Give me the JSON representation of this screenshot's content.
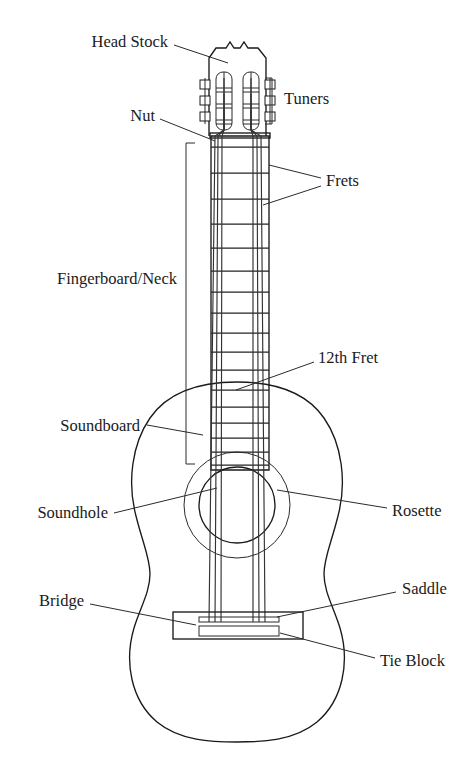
{
  "diagram": {
    "type": "labeled-line-drawing",
    "width": 471,
    "height": 770,
    "background_color": "#ffffff",
    "line_color": "#1a1a1a",
    "text_color": "#1a1a1a"
  },
  "labels": {
    "head_stock": "Head Stock",
    "tuners": "Tuners",
    "nut": "Nut",
    "frets": "Frets",
    "fingerboard_neck": "Fingerboard/Neck",
    "twelfth_fret": "12th Fret",
    "soundboard": "Soundboard",
    "soundhole": "Soundhole",
    "rosette": "Rosette",
    "bridge": "Bridge",
    "saddle": "Saddle",
    "tie_block": "Tie Block"
  },
  "label_positions": {
    "head_stock": {
      "x": 168,
      "y": 43,
      "align": "end"
    },
    "tuners": {
      "x": 284,
      "y": 100,
      "align": "start"
    },
    "nut": {
      "x": 155,
      "y": 117,
      "align": "end"
    },
    "frets": {
      "x": 326,
      "y": 182,
      "align": "start"
    },
    "fingerboard_neck": {
      "x": 177,
      "y": 280,
      "align": "end"
    },
    "twelfth_fret": {
      "x": 318,
      "y": 359,
      "align": "start"
    },
    "soundboard": {
      "x": 140,
      "y": 427,
      "align": "end"
    },
    "soundhole": {
      "x": 108,
      "y": 514,
      "align": "end"
    },
    "rosette": {
      "x": 392,
      "y": 512,
      "align": "start"
    },
    "bridge": {
      "x": 84,
      "y": 602,
      "align": "end"
    },
    "saddle": {
      "x": 402,
      "y": 590,
      "align": "start"
    },
    "tie_block": {
      "x": 380,
      "y": 662,
      "align": "start"
    }
  },
  "leader_lines": {
    "head_stock": [
      [
        174,
        45
      ],
      [
        228,
        63
      ]
    ],
    "nut": [
      [
        160,
        119
      ],
      [
        215,
        141
      ]
    ],
    "frets_upper": [
      [
        321,
        178
      ],
      [
        269,
        165
      ]
    ],
    "frets_lower": [
      [
        321,
        186
      ],
      [
        263,
        205
      ]
    ],
    "twelfth_fret": [
      [
        314,
        362
      ],
      [
        236,
        390
      ]
    ],
    "soundboard": [
      [
        147,
        425
      ],
      [
        203,
        435
      ]
    ],
    "soundhole": [
      [
        114,
        513
      ],
      [
        217,
        488
      ]
    ],
    "rosette": [
      [
        387,
        508
      ],
      [
        277,
        490
      ]
    ],
    "bridge": [
      [
        90,
        604
      ],
      [
        196,
        625
      ]
    ],
    "saddle": [
      [
        396,
        592
      ],
      [
        277,
        617
      ]
    ],
    "tie_block": [
      [
        375,
        658
      ],
      [
        280,
        633
      ]
    ]
  },
  "brackets": {
    "tuners": {
      "x": 272,
      "y_top": 78,
      "y_bottom": 124,
      "tick": 7,
      "side": "right"
    },
    "fingerboard_neck": {
      "x": 186,
      "y_top": 143,
      "y_bottom": 464,
      "tick": 9,
      "side": "left"
    }
  },
  "guitar_geometry": {
    "headstock": {
      "top_y": 41,
      "nut_y": 136,
      "left_x": 208,
      "right_x": 272,
      "crown_notch": true
    },
    "neck": {
      "top_y": 136,
      "bottom_y": 470,
      "left_x": 211,
      "right_x": 269,
      "fret_count": 14
    },
    "strings": {
      "count": 6,
      "top_y": 60,
      "bottom_y": 622,
      "nut_left_x": 214,
      "nut_right_x": 266
    },
    "frets_y": [
      147,
      173,
      199,
      224,
      248,
      271,
      292,
      313,
      333,
      352,
      370,
      387,
      404,
      420,
      435,
      449,
      463
    ],
    "twelfth_fret_y": 390,
    "body": {
      "center_x": 237,
      "top_y": 382,
      "bottom_y": 742,
      "upper_bout_half_width": 88,
      "waist_half_width": 70,
      "lower_bout_half_width": 110
    },
    "soundhole": {
      "cx": 237,
      "cy": 505,
      "r": 38
    },
    "rosette": {
      "cx": 237,
      "cy": 505,
      "r": 53
    },
    "bridge": {
      "x": 173,
      "y": 612,
      "width": 130,
      "height": 27,
      "saddle": {
        "x": 199,
        "y": 617,
        "width": 80,
        "height": 5
      },
      "tie_block": {
        "x": 199,
        "y": 626,
        "width": 80,
        "height": 10
      }
    },
    "tuners": {
      "count_per_side": 3,
      "left_x": 205,
      "right_x": 275,
      "peg_ys": [
        84,
        100,
        116
      ],
      "slot_left": {
        "x": 216,
        "y": 72,
        "width": 16,
        "height": 58
      },
      "slot_right": {
        "x": 239,
        "y": 72,
        "width": 16,
        "height": 58
      },
      "roller_ys": [
        88,
        104,
        120
      ]
    }
  }
}
